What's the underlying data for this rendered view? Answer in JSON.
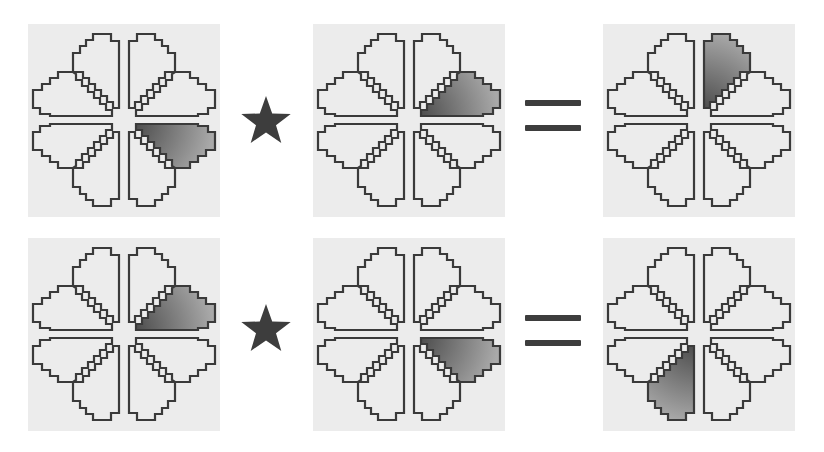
{
  "figure": {
    "type": "petal-pattern-equation-diagram",
    "colors": {
      "background": "#ffffff",
      "tile_background": "#ececec",
      "outline": "#3a3a3a",
      "shade_dark": "#3e3e3e",
      "shade_light": "#a9a9a9",
      "operator": "#3d3d3d"
    },
    "operator_symbol": "★",
    "equals_symbol": "=",
    "petal_names": [
      "TL-v",
      "TL-h",
      "TR-v",
      "TR-h",
      "BL-v",
      "BL-h",
      "BR-v",
      "BR-h"
    ],
    "rows": [
      {
        "label": "row-1",
        "operand_a": {
          "shaded_petal": "BR-h"
        },
        "operator": "★",
        "operand_b": {
          "shaded_petal": "TR-h"
        },
        "equals": "=",
        "result": {
          "shaded_petal": "TR-v"
        }
      },
      {
        "label": "row-2",
        "operand_a": {
          "shaded_petal": "TR-h"
        },
        "operator": "★",
        "operand_b": {
          "shaded_petal": "BR-h"
        },
        "equals": "=",
        "result": {
          "shaded_petal": "BL-v"
        }
      }
    ]
  }
}
